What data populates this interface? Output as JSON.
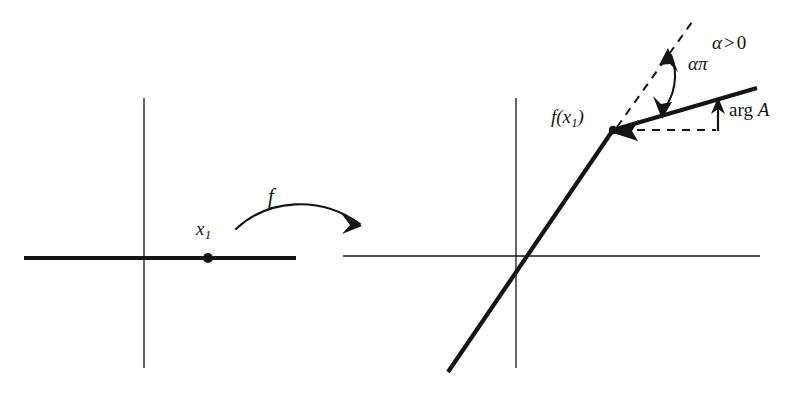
{
  "figure": {
    "type": "mathematical-diagram",
    "background_color": "#ffffff",
    "ink_color": "#141414"
  },
  "left_panel": {
    "name": "domain-plane",
    "axes": {
      "horizontal": {
        "x1": 24,
        "y1": 258,
        "x2": 296,
        "y2": 258,
        "stroke_width": 1.3
      },
      "vertical": {
        "x1": 144,
        "y1": 98,
        "x2": 144,
        "y2": 368,
        "stroke_width": 1.3
      }
    },
    "thick_ray": {
      "x1": 24,
      "y1": 258,
      "x2": 296,
      "y2": 258,
      "stroke_width": 4.0
    },
    "point": {
      "cx": 208,
      "cy": 258,
      "r": 5.0
    },
    "point_label": "x",
    "point_label_sub": "1"
  },
  "map_arrow": {
    "name": "f-map-arrow",
    "label": "f",
    "path": "M 236 229 C 268 199, 320 195, 360 224",
    "stroke_width": 2.1,
    "arrowhead": "M 360 224 L 343 215 L 352 226 L 345 233 Z"
  },
  "right_panel": {
    "name": "image-plane",
    "axes": {
      "horizontal": {
        "x1": 343,
        "y1": 256,
        "x2": 760,
        "y2": 256,
        "stroke_width": 1.3
      },
      "vertical": {
        "x1": 516,
        "y1": 98,
        "x2": 516,
        "y2": 368,
        "stroke_width": 1.3
      }
    },
    "incoming_ray": {
      "x1": 448,
      "y1": 372,
      "x2": 613,
      "y2": 130,
      "stroke_width": 4.2
    },
    "outgoing_ray": {
      "x1": 613,
      "y1": 130,
      "x2": 757,
      "y2": 88,
      "stroke_width": 4.2
    },
    "corner_point": {
      "cx": 613,
      "cy": 130,
      "r": 4.6
    },
    "corner_label": "f(x",
    "corner_label_sub": "1",
    "corner_label_close": ")",
    "dashed_diagonal": {
      "x1": 616,
      "y1": 128,
      "x2": 692,
      "y2": 22,
      "dash": "8 7",
      "stroke_width": 2.0
    },
    "dashed_horizontal": {
      "x1": 620,
      "y1": 130,
      "x2": 718,
      "y2": 130,
      "dash": "8 7",
      "stroke_width": 2.0
    },
    "corner_tick": {
      "x1": 718,
      "y1": 130,
      "x2": 718,
      "y2": 116,
      "stroke_width": 2.0
    },
    "vertex_arrowhead": "M 613 130 L 637 122 L 631 131 L 636 139 Z",
    "angle_arc": {
      "path": "M 672 52 C 680 72, 676 96, 662 114",
      "stroke_width": 2.1,
      "arrowhead_top": "M 670 50 L 679 70 L 672 63 L 662 64 Z",
      "arrowhead_bottom": "M 661 116 L 655 95 L 663 103 L 672 100 Z"
    },
    "arg_arrow": {
      "x1": 718,
      "y1": 131,
      "x2": 718,
      "y2": 101,
      "stroke_width": 2.2,
      "arrowhead": "M 718 99 L 712 113 L 718 109 L 724 113 Z"
    },
    "labels": {
      "angle": "απ",
      "condition_alpha": "α",
      "condition_op": ">",
      "condition_value": "0",
      "arg_prefix": "arg",
      "arg_symbol": "A"
    }
  }
}
